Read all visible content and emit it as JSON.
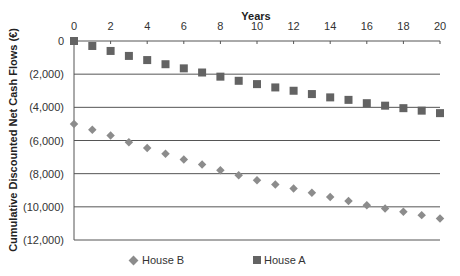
{
  "chart_data": {
    "type": "scatter",
    "title": "",
    "xlabel": "Years",
    "ylabel": "Cumulative Discounted Net Cash Flows (€)",
    "xlim": [
      0,
      20
    ],
    "ylim": [
      -12000,
      0
    ],
    "x_ticks": [
      "0",
      "2",
      "4",
      "6",
      "8",
      "10",
      "12",
      "14",
      "16",
      "18",
      "20"
    ],
    "y_ticks": [
      "0",
      "(2,000)",
      "(4,000)",
      "(6,000)",
      "(8,000)",
      "(10,000)",
      "(12,000)"
    ],
    "x_axis_position": "top",
    "grid": true,
    "legend_position": "bottom",
    "x": [
      0,
      1,
      2,
      3,
      4,
      5,
      6,
      7,
      8,
      9,
      10,
      11,
      12,
      13,
      14,
      15,
      16,
      17,
      18,
      19,
      20
    ],
    "series": [
      {
        "name": "House A",
        "marker": "square",
        "color": "#636363",
        "values": [
          0,
          -300,
          -600,
          -900,
          -1150,
          -1400,
          -1650,
          -1900,
          -2150,
          -2400,
          -2600,
          -2800,
          -3000,
          -3200,
          -3400,
          -3550,
          -3750,
          -3900,
          -4050,
          -4200,
          -4350
        ]
      },
      {
        "name": "House B",
        "marker": "diamond",
        "color": "#8c8c8c",
        "values": [
          -5000,
          -5350,
          -5700,
          -6100,
          -6450,
          -6800,
          -7150,
          -7450,
          -7800,
          -8100,
          -8400,
          -8650,
          -8900,
          -9150,
          -9400,
          -9650,
          -9900,
          -10100,
          -10300,
          -10500,
          -10700
        ]
      }
    ]
  },
  "legend": {
    "house_b": "House B",
    "house_a": "House A"
  }
}
